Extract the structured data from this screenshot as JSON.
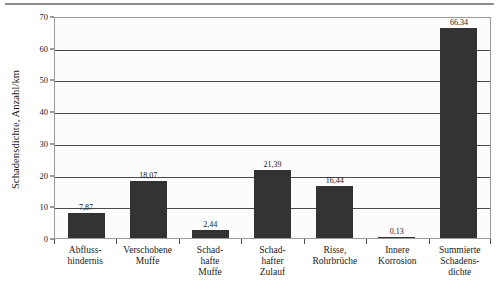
{
  "chart_data": {
    "type": "bar",
    "title": "",
    "subtitle": "",
    "xlabel": "",
    "ylabel": "Schadensdichte, Anzahl/km",
    "ylim": [
      0,
      70
    ],
    "ytick_step": 10,
    "yticks": [
      0,
      10,
      20,
      30,
      40,
      50,
      60,
      70
    ],
    "ytick_labels": [
      "0",
      "10",
      "20",
      "30",
      "40",
      "50",
      "60",
      "70"
    ],
    "grid": true,
    "grid_axis": "y",
    "legend": false,
    "legend_position": "none",
    "decimal_separator": ",",
    "bar_color": "#333333",
    "plot_background": "#fcfcfc",
    "categories": [
      "Abfluss-\nhindernis",
      "Verschobene\nMuffe",
      "Schad-\nhafte\nMuffe",
      "Schad-\nhafter\nZulauf",
      "Risse,\nRohrbrüche",
      "Innere\nKorrosion",
      "Summierte\nSchadens-\ndichte"
    ],
    "category_lines": [
      [
        "Abfluss-",
        "hindernis"
      ],
      [
        "Verschobene",
        "Muffe"
      ],
      [
        "Schad-",
        "hafte",
        "Muffe"
      ],
      [
        "Schad-",
        "hafter",
        "Zulauf"
      ],
      [
        "Risse,",
        "Rohrbrüche"
      ],
      [
        "Innere",
        "Korrosion"
      ],
      [
        "Summierte",
        "Schadens-",
        "dichte"
      ]
    ],
    "values": [
      7.87,
      18.07,
      2.44,
      21.39,
      16.44,
      0.13,
      66.34
    ],
    "value_labels": [
      "7,87",
      "18,07",
      "2,44",
      "21,39",
      "16,44",
      "0,13",
      "66,34"
    ]
  }
}
